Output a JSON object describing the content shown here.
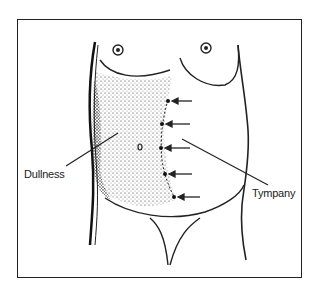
{
  "figure": {
    "labels": {
      "dullness": "Dullness",
      "tympany": "Tympany"
    },
    "arrows_count": 5,
    "colors": {
      "ink": "#222222",
      "background": "#ffffff"
    }
  }
}
